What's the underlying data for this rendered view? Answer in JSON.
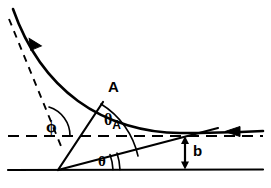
{
  "figure": {
    "kind": "scattering-geometry-diagram",
    "width": 271,
    "height": 188,
    "background_color": "#ffffff",
    "stroke_color": "#000000"
  },
  "labels": {
    "point_A": "A",
    "angle_phi": "ϕ",
    "angle_theta_A_symbol": "θ",
    "angle_theta_A_subscript": "A",
    "angle_theta": "θ",
    "impact_parameter": "b"
  },
  "elements": {
    "trajectory_curve_name": "hyperbolic-trajectory",
    "asymptote_name": "outgoing-asymptote-dashed",
    "axis_dashed_name": "horizontal-dashed-axis",
    "axis_solid_name": "horizontal-solid-baseline",
    "radius_vector_name": "radius-vector-to-A",
    "theta_ray_name": "theta-ray",
    "arrow_incoming_name": "incoming-direction-arrow",
    "arrow_outgoing_name": "outgoing-direction-arrow",
    "impact_arrow_name": "impact-parameter-arrow"
  },
  "geometry": {
    "focus_x": 58,
    "focus_y": 170,
    "point_A_x": 103,
    "point_A_y": 102,
    "dashed_axis_y": 136,
    "solid_axis_y": 170,
    "impact_arrow_x": 185,
    "impact_parameter_top_y": 137,
    "impact_parameter_bottom_y": 169
  }
}
